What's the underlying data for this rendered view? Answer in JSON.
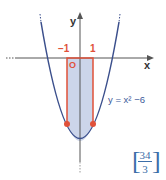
{
  "diagram": {
    "axes": {
      "x_label": "x",
      "y_label": "y"
    },
    "ticks": {
      "left": "−1",
      "right": "1"
    },
    "origin_label": "O",
    "equation": "y = x² −6",
    "answer": {
      "numerator": "34",
      "denominator": "3"
    },
    "colors": {
      "curve": "#3b4f8c",
      "rect": "#e0513a",
      "fill": "#c6d0e8",
      "axis": "#555555",
      "answer": "#3b6ea8"
    }
  }
}
